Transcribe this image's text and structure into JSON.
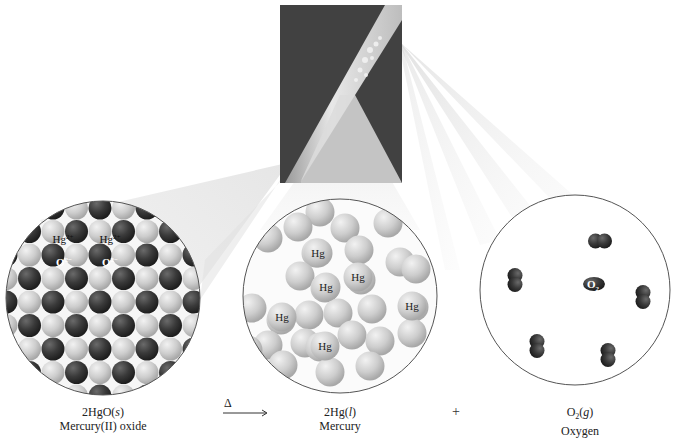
{
  "figure": {
    "equation": {
      "reactant": {
        "formula": "2HgO(s)",
        "coef": "2HgO",
        "state": "s",
        "name": "Mercury(II) oxide"
      },
      "arrow_label": "Δ",
      "product1": {
        "formula": "2Hg(l)",
        "coef": "2Hg",
        "state": "l",
        "name": "Mercury"
      },
      "plus": "+",
      "product2": {
        "formula": "O2(g)",
        "coef": "O",
        "sub": "2",
        "state": "g",
        "name": "Oxygen"
      }
    },
    "panels": [
      {
        "id": "hgo-lattice",
        "description": "Ionic lattice of alternating Hg2+ (light) and O2- (dark) ions",
        "labels": [
          {
            "text": "Hg",
            "sup": "2+"
          },
          {
            "text": "Hg",
            "sup": "2+"
          },
          {
            "text": "O",
            "sup": "2−"
          },
          {
            "text": "O",
            "sup": "2−"
          }
        ]
      },
      {
        "id": "liquid-mercury",
        "description": "Loosely packed Hg atoms",
        "labels": [
          "Hg",
          "Hg",
          "Hg",
          "Hg",
          "Hg",
          "Hg"
        ]
      },
      {
        "id": "oxygen-gas",
        "description": "Widely spaced O2 molecules",
        "labels": [
          {
            "text": "O",
            "sub": "2"
          }
        ]
      }
    ],
    "photo": {
      "description": "Test tube heating red HgO; mercury droplets condense on the glass"
    },
    "colors": {
      "dark_ion": "#3a3a3a",
      "light_ion": "#cfcfcf",
      "circle_border": "#555555",
      "photo_bg": "#3b3b3b"
    }
  }
}
